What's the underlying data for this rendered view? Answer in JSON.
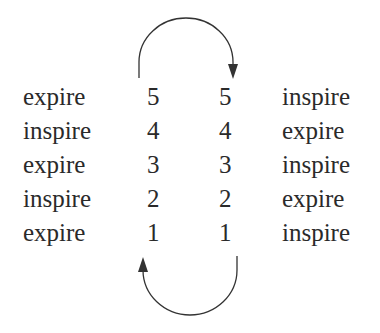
{
  "diagram": {
    "rows": [
      {
        "left_word": "expire",
        "left_num": "5",
        "right_num": "5",
        "right_word": "inspire"
      },
      {
        "left_word": "inspire",
        "left_num": "4",
        "right_num": "4",
        "right_word": "expire"
      },
      {
        "left_word": "expire",
        "left_num": "3",
        "right_num": "3",
        "right_word": "inspire"
      },
      {
        "left_word": "inspire",
        "left_num": "2",
        "right_num": "2",
        "right_word": "expire"
      },
      {
        "left_word": "expire",
        "left_num": "1",
        "right_num": "1",
        "right_word": "inspire"
      }
    ],
    "arrows": [
      {
        "name": "top-arc-arrow",
        "from": "left 5",
        "to": "right 5",
        "direction": "clockwise over top"
      },
      {
        "name": "bottom-arc-arrow",
        "from": "right 1",
        "to": "left 1",
        "direction": "clockwise under bottom"
      }
    ],
    "colors": {
      "text": "#2a2a2a",
      "arrow": "#333333",
      "background": "#ffffff"
    }
  }
}
